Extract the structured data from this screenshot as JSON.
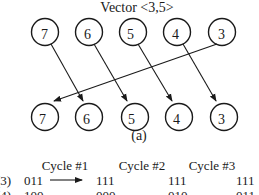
{
  "diagram": {
    "title": "Vector <3,5>",
    "caption": "(a)",
    "top_nodes": [
      {
        "label": "7",
        "cx": 45,
        "cy": 32
      },
      {
        "label": "6",
        "cx": 89,
        "cy": 32
      },
      {
        "label": "5",
        "cx": 133,
        "cy": 32
      },
      {
        "label": "4",
        "cx": 177,
        "cy": 32
      },
      {
        "label": "3",
        "cx": 222,
        "cy": 32
      }
    ],
    "bottom_nodes": [
      {
        "label": "7",
        "cx": 45,
        "cy": 117
      },
      {
        "label": "6",
        "cx": 89,
        "cy": 117
      },
      {
        "label": "5",
        "cx": 135,
        "cy": 117
      },
      {
        "label": "4",
        "cx": 179,
        "cy": 117
      },
      {
        "label": "3",
        "cx": 224,
        "cy": 117
      }
    ],
    "edges": [
      {
        "from": "top-7",
        "to": "bottom-6"
      },
      {
        "from": "top-6",
        "to": "bottom-5"
      },
      {
        "from": "top-5",
        "to": "bottom-4"
      },
      {
        "from": "top-4",
        "to": "bottom-3"
      },
      {
        "from": "top-3",
        "to": "bottom-7"
      }
    ]
  },
  "table": {
    "headers": [
      "Cycle #1",
      "Cycle #2",
      "Cycle #3"
    ],
    "rows": [
      {
        "label": "(3)",
        "initial": "011",
        "cycle1": "111",
        "cycle2": "111",
        "cycle3": "111"
      },
      {
        "label": "(4)",
        "initial": "100",
        "cycle1": "000",
        "cycle2": "010",
        "cycle3": "011"
      }
    ]
  }
}
